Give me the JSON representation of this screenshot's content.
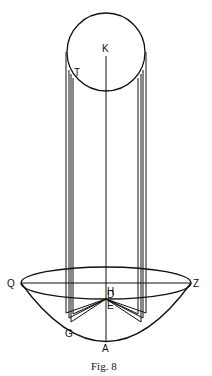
{
  "figure": {
    "caption": "Fig. 8",
    "labels": {
      "K": "K",
      "T": "T",
      "Q": "Q",
      "D": "D",
      "Z": "Z",
      "E": "E",
      "H": "H",
      "G": "G",
      "A": "A"
    },
    "stroke_color": "#111111",
    "background": "#ffffff"
  }
}
